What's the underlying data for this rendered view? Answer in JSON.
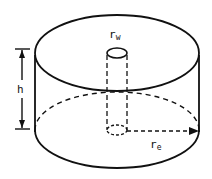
{
  "diagram": {
    "labels": {
      "height": "h",
      "well_radius_main": "r",
      "well_radius_sub": "w",
      "outer_radius_main": "r",
      "outer_radius_sub": "e"
    },
    "colors": {
      "stroke": "#111111",
      "background": "#ffffff"
    }
  }
}
